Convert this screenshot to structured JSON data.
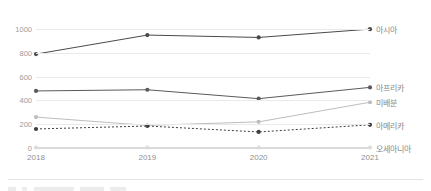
{
  "chart_data": {
    "type": "line",
    "title": "",
    "subtitle": "",
    "xlabel": "",
    "ylabel": "",
    "categories": [
      "2018",
      "2019",
      "2020",
      "2021"
    ],
    "x": [
      2018,
      2019,
      2020,
      2021
    ],
    "ylim": [
      0,
      1060
    ],
    "xlim": [
      2018,
      2021
    ],
    "yticks": [
      0,
      200,
      400,
      600,
      800,
      1000
    ],
    "ytick_labels": [
      "0",
      "200",
      "400",
      "600",
      "800",
      "1000"
    ],
    "xtick_labels": [
      "2018",
      "2019",
      "2020",
      "2021"
    ],
    "grid": true,
    "grid_axis": "y",
    "legend_position": "right-of-line-ends",
    "series": [
      {
        "name": "아시아",
        "values": [
          790,
          950,
          930,
          1000
        ],
        "color": "#4a4a4a",
        "style": "solid",
        "marker": "circle",
        "label_y": 1000
      },
      {
        "name": "아프리카",
        "values": [
          480,
          490,
          415,
          510
        ],
        "color": "#5a5a5a",
        "style": "solid",
        "marker": "circle",
        "label_y": 510
      },
      {
        "name": "미배분",
        "values": [
          260,
          190,
          220,
          385
        ],
        "color": "#bdbdbd",
        "style": "solid",
        "marker": "circle",
        "label_y": 385
      },
      {
        "name": "아메리카",
        "values": [
          160,
          185,
          135,
          195
        ],
        "color": "#3f3f3f",
        "style": "dashed",
        "marker": "circle",
        "label_y": 195
      },
      {
        "name": "오세아니아",
        "values": [
          4,
          4,
          4,
          4
        ],
        "color": "#dcdcdc",
        "style": "solid",
        "marker": "circle",
        "label_y": 4
      }
    ]
  },
  "colors": {
    "background": "#ffffff",
    "gridline": "#e9e9e9",
    "axis": "#d8d8d8",
    "tick_text": "#9b9b9b",
    "legend_text": "#8a8a8a",
    "divider": "#e3e3e3"
  }
}
